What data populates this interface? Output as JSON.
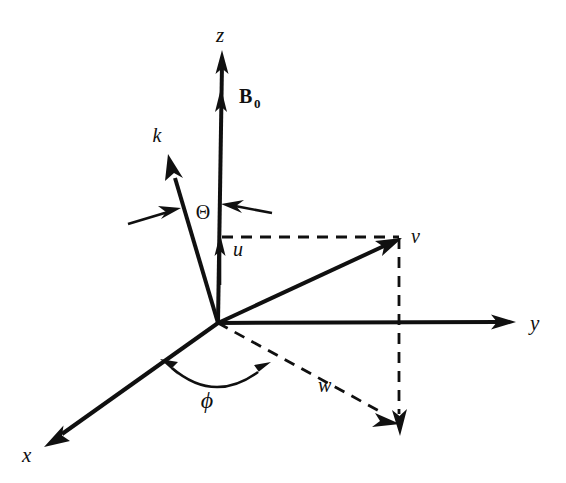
{
  "figure": {
    "kind": "3d-coordinate-vector-diagram",
    "background_color": "#ffffff",
    "ink_color": "#101010",
    "width": 566,
    "height": 483
  },
  "axes": [
    {
      "id": "z",
      "label": "z",
      "direction": "up",
      "style": "solid",
      "arrowhead": true
    },
    {
      "id": "y",
      "label": "y",
      "direction": "right",
      "style": "solid",
      "arrowhead": true
    },
    {
      "id": "x",
      "label": "x",
      "direction": "down-left",
      "style": "solid",
      "arrowhead": true
    }
  ],
  "vectors": [
    {
      "id": "k",
      "label": "k",
      "style": "solid",
      "arrowhead": true,
      "description": "wave vector, up-left from origin"
    },
    {
      "id": "B0",
      "label": "B",
      "subscript": "0",
      "style": "solid",
      "arrowhead": true,
      "description": "static magnetic field along z"
    },
    {
      "id": "v",
      "label": "v",
      "style": "solid",
      "arrowhead": true,
      "description": "vector to projection point up-right of origin"
    },
    {
      "id": "u",
      "label": "u",
      "style": "solid",
      "arrowhead": true,
      "description": "short component along z-axis"
    },
    {
      "id": "w",
      "label": "w",
      "style": "dashed",
      "arrowhead": true,
      "description": "in-plane projection component"
    }
  ],
  "angles": [
    {
      "id": "theta",
      "label": "Θ",
      "between": [
        "k",
        "z"
      ],
      "marker": "double-arrow-pair"
    },
    {
      "id": "phi",
      "label": "ϕ",
      "between": [
        "x",
        "w"
      ],
      "marker": "double-headed-arc"
    }
  ],
  "construction_lines": [
    {
      "id": "v-horizontal-projection",
      "style": "dashed",
      "from": "z-axis",
      "to": "v-tip"
    },
    {
      "id": "v-vertical-drop",
      "style": "dashed",
      "from": "v-tip",
      "to": "w-tip",
      "arrowhead": true
    },
    {
      "id": "w-ray",
      "style": "dashed",
      "from": "origin",
      "to": "w-tip",
      "arrowhead": true
    }
  ]
}
